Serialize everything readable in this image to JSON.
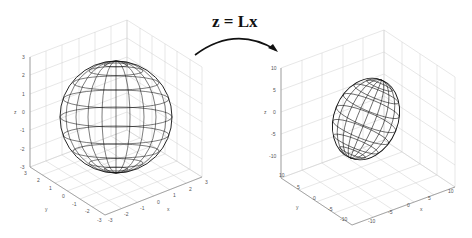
{
  "equation": "z = Lx",
  "left_plot": {
    "shape": "sphere",
    "z_ticks": [
      "3",
      "2",
      "1",
      "0",
      "-1",
      "-2",
      "-3"
    ],
    "y_ticks": [
      "3",
      "2",
      "1",
      "0",
      "-1",
      "-2",
      "-3"
    ],
    "x_ticks": [
      "-3",
      "-2",
      "-1",
      "0",
      "1",
      "2",
      "3"
    ],
    "xlabel": "x",
    "ylabel": "y",
    "zlabel": "z"
  },
  "right_plot": {
    "shape": "ellipsoid",
    "z_ticks": [
      "10",
      "5",
      "0",
      "-5",
      "-10"
    ],
    "y_ticks": [
      "10",
      "5",
      "0",
      "-5",
      "-10"
    ],
    "x_ticks": [
      "-10",
      "-5",
      "0",
      "5",
      "10"
    ],
    "xlabel": "x",
    "ylabel": "y",
    "zlabel": "z"
  },
  "colors": {
    "wire": "#111111",
    "grid": "#cfcfcf",
    "axis": "#777777"
  }
}
